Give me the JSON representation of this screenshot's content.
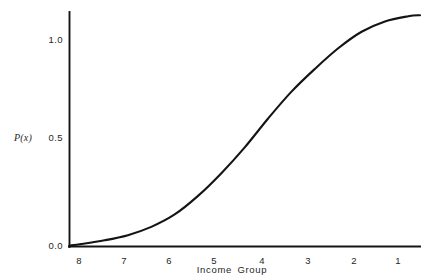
{
  "chart_data": {
    "type": "line",
    "title": "",
    "xlabel": "Income Group",
    "ylabel": "P(x)",
    "x_tick_labels": [
      "8",
      "7",
      "6",
      "5",
      "4",
      "3",
      "2",
      "1"
    ],
    "y_tick_labels": [
      "0.0",
      "0.5",
      "1.0"
    ],
    "y_tick_values": [
      0.0,
      0.5,
      1.0
    ],
    "xlim": [
      8.25,
      0.75
    ],
    "ylim": [
      0.0,
      1.19
    ],
    "grid": false,
    "legend": false,
    "x_axis_direction": "decreasing-left-to-right",
    "series": [
      {
        "name": "P(x)",
        "color": "#141414",
        "x": [
          8.25,
          8.0,
          7.5,
          7.0,
          6.5,
          6.0,
          5.5,
          5.0,
          4.5,
          4.0,
          3.5,
          3.0,
          2.5,
          2.0,
          1.5,
          1.0,
          0.75
        ],
        "values": [
          0.005,
          0.012,
          0.03,
          0.055,
          0.095,
          0.155,
          0.245,
          0.355,
          0.48,
          0.62,
          0.75,
          0.86,
          0.96,
          1.04,
          1.09,
          1.115,
          1.12
        ]
      }
    ],
    "annotations": []
  },
  "axes": {
    "y_axis_name": "vertical-axis",
    "x_axis_name": "horizontal-axis"
  }
}
